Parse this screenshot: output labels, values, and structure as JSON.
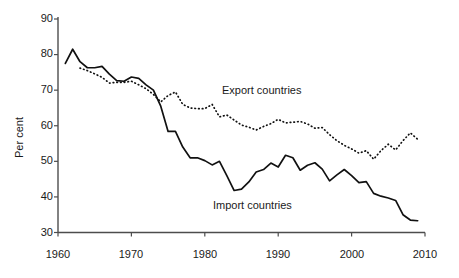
{
  "chart_data": {
    "type": "line",
    "title": "",
    "subtitle": "",
    "xlabel": "",
    "ylabel": "Per cent",
    "xlim": [
      1960,
      2010
    ],
    "ylim": [
      30,
      90
    ],
    "x_ticks": [
      "1960",
      "1970",
      "1980",
      "1990",
      "2000",
      "2010"
    ],
    "y_ticks": [
      "30",
      "40",
      "50",
      "60",
      "70",
      "80",
      "90"
    ],
    "grid": false,
    "legend_position": "inline-annotations",
    "annotations": [
      {
        "text": "Export countries",
        "x": 1989,
        "y": 69.5
      },
      {
        "text": "Import countries",
        "x": 1984,
        "y": 38.5
      }
    ],
    "series": [
      {
        "name": "Import countries",
        "style": "solid",
        "color": "#000000",
        "x": [
          1961,
          1962,
          1963,
          1964,
          1965,
          1966,
          1967,
          1968,
          1969,
          1970,
          1971,
          1972,
          1973,
          1974,
          1975,
          1976,
          1977,
          1978,
          1979,
          1980,
          1981,
          1982,
          1983,
          1984,
          1985,
          1986,
          1987,
          1988,
          1989,
          1990,
          1991,
          1992,
          1993,
          1994,
          1995,
          1996,
          1997,
          1998,
          1999,
          2000,
          2001,
          2002,
          2003,
          2004,
          2005,
          2006,
          2007,
          2008,
          2009
        ],
        "values": [
          77.5,
          81.5,
          78.0,
          76.3,
          76.3,
          76.7,
          74.5,
          72.7,
          72.5,
          73.7,
          73.3,
          71.5,
          70.0,
          65.5,
          58.4,
          58.4,
          54.0,
          51.0,
          51.0,
          50.2,
          49.0,
          50.0,
          46.0,
          41.8,
          42.2,
          44.2,
          47.0,
          47.7,
          49.5,
          48.4,
          51.7,
          51.0,
          47.5,
          48.9,
          49.6,
          47.8,
          44.5,
          46.2,
          47.7,
          46.0,
          44.0,
          44.3,
          41.0,
          40.2,
          39.7,
          39.0,
          35.0,
          33.5,
          33.3
        ],
        "note": "Solid black line"
      },
      {
        "name": "Export countries",
        "style": "dotted",
        "color": "#000000",
        "x": [
          1963,
          1964,
          1965,
          1966,
          1967,
          1968,
          1969,
          1970,
          1971,
          1972,
          1973,
          1974,
          1975,
          1976,
          1977,
          1978,
          1979,
          1980,
          1981,
          1982,
          1983,
          1984,
          1985,
          1986,
          1987,
          1988,
          1989,
          1990,
          1991,
          1992,
          1993,
          1994,
          1995,
          1996,
          1997,
          1998,
          1999,
          2000,
          2001,
          2002,
          2003,
          2004,
          2005,
          2006,
          2007,
          2008,
          2009
        ],
        "values": [
          76.2,
          75.5,
          74.6,
          73.6,
          72.0,
          72.2,
          72.2,
          72.5,
          71.5,
          70.4,
          68.8,
          66.7,
          68.5,
          69.5,
          66.0,
          65.0,
          64.8,
          64.8,
          66.0,
          62.5,
          63.0,
          61.6,
          60.2,
          59.6,
          58.8,
          59.8,
          60.6,
          61.8,
          60.8,
          61.0,
          61.2,
          60.5,
          59.3,
          59.5,
          57.5,
          55.8,
          54.5,
          53.5,
          52.3,
          53.0,
          50.6,
          53.0,
          54.8,
          53.2,
          55.8,
          58.0,
          56.2
        ],
        "note": "Dotted black line"
      }
    ]
  },
  "axis": {
    "y_title": "Per cent"
  },
  "labels": {
    "export_series": "Export countries",
    "import_series": "Import countries"
  }
}
